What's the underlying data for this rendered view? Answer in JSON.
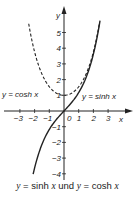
{
  "chart_data": {
    "type": "line",
    "title": "y = sinh x und y = cosh x",
    "xlabel": "x",
    "ylabel": "y",
    "xlim": [
      -3.5,
      3.8
    ],
    "ylim": [
      -4.4,
      5.9
    ],
    "x_ticks": [
      -3,
      -2,
      -1,
      0,
      1,
      2,
      3
    ],
    "y_ticks": [
      -4,
      -3,
      -2,
      -1,
      1,
      2,
      3,
      4,
      5
    ],
    "x_tick_labels": [
      "−3",
      "−2",
      "−1",
      "0",
      "1",
      "2",
      "3"
    ],
    "y_tick_labels": [
      "−4",
      "−3",
      "−2",
      "−1",
      "1",
      "2",
      "3",
      "4",
      "5"
    ],
    "grid": false,
    "series": [
      {
        "name": "y = cosh x",
        "style": "dashed",
        "x": [
          -2.4,
          -2,
          -1.5,
          -1,
          -0.5,
          0,
          0.5,
          1,
          1.5,
          2,
          2.4
        ],
        "values": [
          5.56,
          3.76,
          2.35,
          1.54,
          1.13,
          1.0,
          1.13,
          1.54,
          2.35,
          3.76,
          5.56
        ]
      },
      {
        "name": "y = sinh x",
        "style": "solid",
        "x": [
          -2.1,
          -2,
          -1.5,
          -1,
          -0.5,
          0,
          0.5,
          1,
          1.5,
          2,
          2.45
        ],
        "values": [
          -4.02,
          -3.63,
          -2.13,
          -1.18,
          -0.52,
          0,
          0.52,
          1.18,
          2.13,
          3.63,
          5.75
        ]
      }
    ],
    "annotations": [
      {
        "text": "y = cosh x",
        "near": [
          -2.6,
          1.1
        ]
      },
      {
        "text": "y = sinh x",
        "near": [
          1.2,
          1.1
        ]
      }
    ]
  },
  "labels": {
    "axis_x": "x",
    "axis_y": "y",
    "cosh_label": "y = cosh x",
    "sinh_label": "y = sinh x",
    "caption_y1": "y",
    "caption_eq1": " = sinh ",
    "caption_x1": "x",
    "caption_und": " und ",
    "caption_y2": "y",
    "caption_eq2": " = cosh ",
    "caption_x2": "x"
  }
}
